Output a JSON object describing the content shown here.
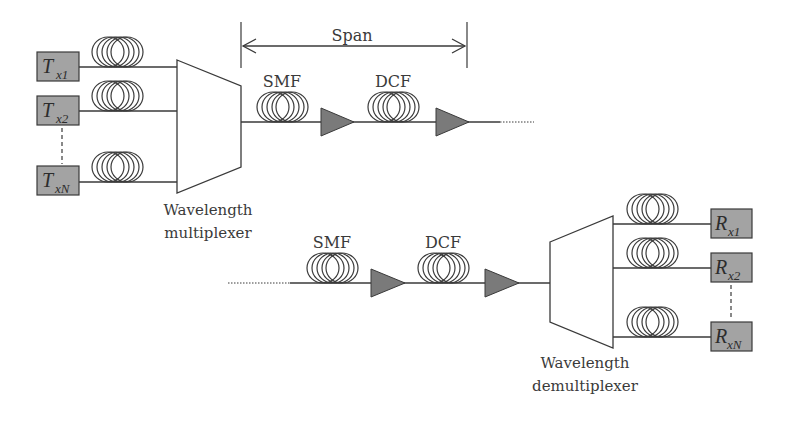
{
  "diagram": {
    "colors": {
      "line": "#3a3a3a",
      "box_fill": "#a3a3a3",
      "amplifier_fill": "#7a7a7a",
      "background": "#ffffff"
    },
    "span_label": "Span",
    "multiplexer": {
      "label_line1": "Wavelength",
      "label_line2": "multiplexer"
    },
    "demultiplexer": {
      "label_line1": "Wavelength",
      "label_line2": "demultiplexer"
    },
    "transmitters": [
      {
        "main": "T",
        "sub": "x1"
      },
      {
        "main": "T",
        "sub": "x2"
      },
      {
        "main": "T",
        "sub": "xN"
      }
    ],
    "receivers": [
      {
        "main": "R",
        "sub": "x1"
      },
      {
        "main": "R",
        "sub": "x2"
      },
      {
        "main": "R",
        "sub": "xN"
      }
    ],
    "top_link": {
      "fiber1": "SMF",
      "fiber2": "DCF"
    },
    "bottom_link": {
      "fiber1": "SMF",
      "fiber2": "DCF"
    }
  }
}
